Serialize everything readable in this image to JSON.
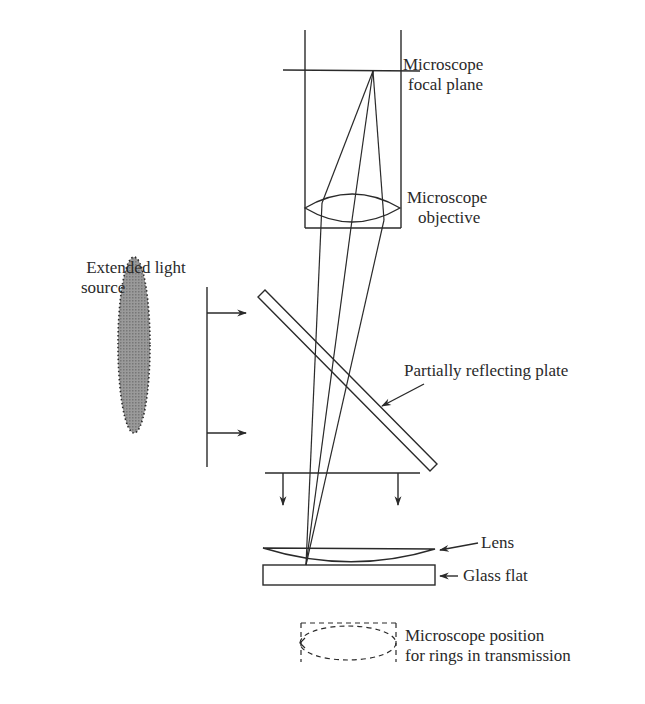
{
  "diagram": {
    "type": "optical setup — Newton's rings apparatus",
    "labels": {
      "focal_plane": [
        "Microscope",
        "focal plane"
      ],
      "objective": [
        "Microscope",
        "objective"
      ],
      "light_source": [
        "Extended light",
        "source"
      ],
      "plate": "Partially reflecting plate",
      "lens": "Lens",
      "glass_flat": "Glass flat",
      "transmission": [
        "Microscope position",
        "for rings in transmission"
      ]
    },
    "colors": {
      "line": "#2a2a2a",
      "source_fill": "#8a8a8a",
      "background": "#ffffff"
    }
  }
}
